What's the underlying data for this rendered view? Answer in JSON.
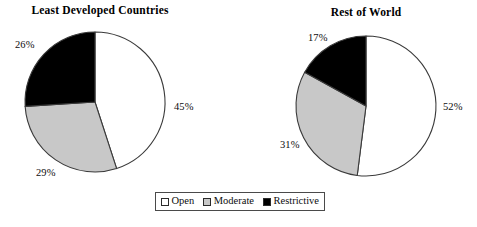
{
  "figure": {
    "background": "#ffffff",
    "width": 477,
    "height": 227
  },
  "panels": [
    {
      "id": "least-developed-countries",
      "title": "Least Developed Countries",
      "labels": {
        "open": "45%",
        "moderate": "29%",
        "restrictive": "26%"
      }
    },
    {
      "id": "rest-of-world",
      "title": "Rest of World",
      "labels": {
        "open": "52%",
        "moderate": "31%",
        "restrictive": "17%"
      }
    }
  ],
  "legend": {
    "items": [
      {
        "label": "Open",
        "color": "#ffffff"
      },
      {
        "label": "Moderate",
        "color": "#c8c8c8"
      },
      {
        "label": "Restrictive",
        "color": "#000000"
      }
    ]
  },
  "colors": {
    "open": "#ffffff",
    "moderate": "#c8c8c8",
    "restrictive": "#000000",
    "outline": "#3a3a3a",
    "text": "#0d0d0d"
  },
  "chart_data": [
    {
      "type": "pie",
      "title": "Least Developed Countries",
      "categories": [
        "Open",
        "Moderate",
        "Restrictive"
      ],
      "values": [
        45,
        29,
        26
      ],
      "value_labels": [
        "45%",
        "29%",
        "26%"
      ],
      "units": "percent",
      "colors": [
        "#ffffff",
        "#c8c8c8",
        "#000000"
      ],
      "start_angle_deg": 0,
      "direction": "clockwise",
      "legend_position": "bottom-center",
      "grid": false
    },
    {
      "type": "pie",
      "title": "Rest of World",
      "categories": [
        "Open",
        "Moderate",
        "Restrictive"
      ],
      "values": [
        52,
        31,
        17
      ],
      "value_labels": [
        "52%",
        "31%",
        "17%"
      ],
      "units": "percent",
      "colors": [
        "#ffffff",
        "#c8c8c8",
        "#000000"
      ],
      "start_angle_deg": 0,
      "direction": "clockwise",
      "legend_position": "bottom-center",
      "grid": false
    }
  ]
}
